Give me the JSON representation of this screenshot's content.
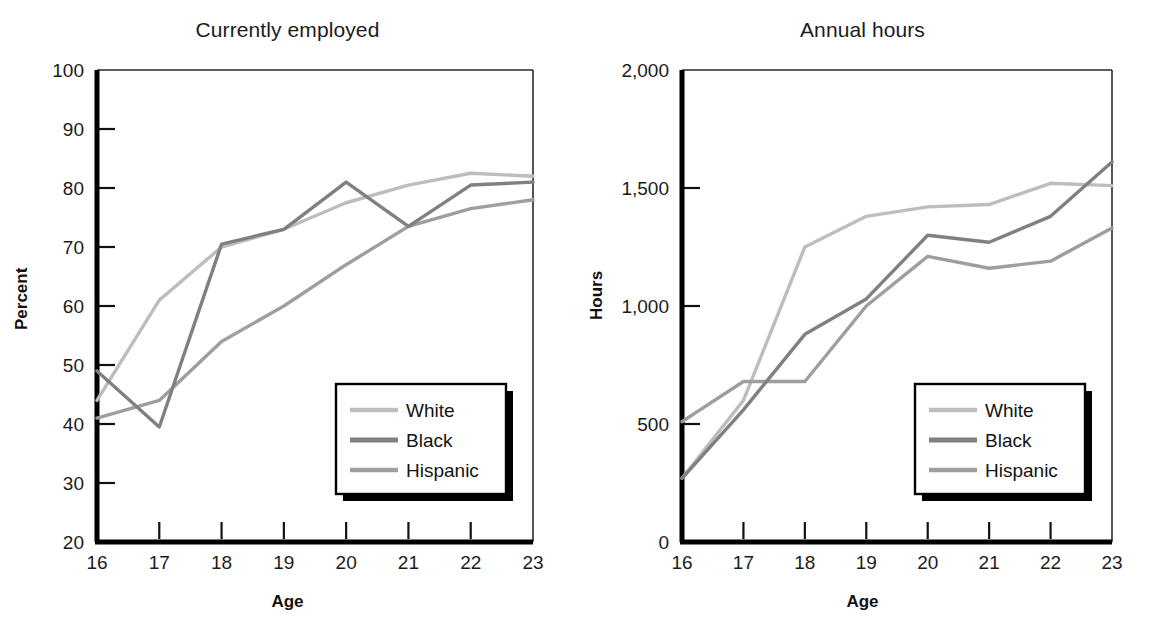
{
  "figure": {
    "background": "#ffffff",
    "series_colors": {
      "White": "#bdbdbd",
      "Black": "#808080",
      "Hispanic": "#9e9e9e"
    },
    "axis_color": "#000000",
    "legend": {
      "items": [
        "White",
        "Black",
        "Hispanic"
      ],
      "border_color": "#000000",
      "shadow_color": "#000000",
      "fill": "#ffffff"
    }
  },
  "panels": {
    "left": {
      "title": "Currently employed",
      "xlabel": "Age",
      "ylabel": "Percent",
      "ytick_labels": [
        "100",
        "90",
        "80",
        "70",
        "60",
        "50",
        "40",
        "30",
        "20"
      ],
      "xtick_labels": [
        "16",
        "17",
        "18",
        "19",
        "20",
        "21",
        "22",
        "23"
      ]
    },
    "right": {
      "title": "Annual hours",
      "xlabel": "Age",
      "ylabel": "Hours",
      "ytick_labels": [
        "2,000",
        "1,500",
        "1,000",
        "500",
        "0"
      ],
      "xtick_labels": [
        "16",
        "17",
        "18",
        "19",
        "20",
        "21",
        "22",
        "23"
      ]
    }
  },
  "chart_data": [
    {
      "type": "line",
      "title": "Currently employed",
      "xlabel": "Age",
      "ylabel": "Percent",
      "x": [
        16,
        17,
        18,
        19,
        20,
        21,
        22,
        23
      ],
      "xlim": [
        16,
        23
      ],
      "ylim": [
        20,
        100
      ],
      "yticks": [
        20,
        30,
        40,
        50,
        60,
        70,
        80,
        90,
        100
      ],
      "grid": false,
      "legend_position": "lower right",
      "series": [
        {
          "name": "White",
          "color": "#bdbdbd",
          "values": [
            44.0,
            61.0,
            70.0,
            73.0,
            77.5,
            80.5,
            82.5,
            82.0
          ]
        },
        {
          "name": "Black",
          "color": "#808080",
          "values": [
            49.0,
            39.5,
            70.5,
            73.0,
            81.0,
            73.5,
            80.5,
            81.0
          ]
        },
        {
          "name": "Hispanic",
          "color": "#9e9e9e",
          "values": [
            41.0,
            44.0,
            54.0,
            60.0,
            67.0,
            73.5,
            76.5,
            78.0
          ]
        }
      ]
    },
    {
      "type": "line",
      "title": "Annual hours",
      "xlabel": "Age",
      "ylabel": "Hours",
      "x": [
        16,
        17,
        18,
        19,
        20,
        21,
        22,
        23
      ],
      "xlim": [
        16,
        23
      ],
      "ylim": [
        0,
        2000
      ],
      "yticks": [
        0,
        500,
        1000,
        1500,
        2000
      ],
      "grid": false,
      "legend_position": "lower right",
      "series": [
        {
          "name": "White",
          "color": "#bdbdbd",
          "values": [
            270,
            600,
            1250,
            1380,
            1420,
            1430,
            1520,
            1510
          ]
        },
        {
          "name": "Black",
          "color": "#808080",
          "values": [
            270,
            560,
            880,
            1030,
            1300,
            1270,
            1380,
            1610
          ]
        },
        {
          "name": "Hispanic",
          "color": "#9e9e9e",
          "values": [
            510,
            680,
            680,
            1000,
            1210,
            1160,
            1190,
            1330
          ]
        }
      ]
    }
  ]
}
